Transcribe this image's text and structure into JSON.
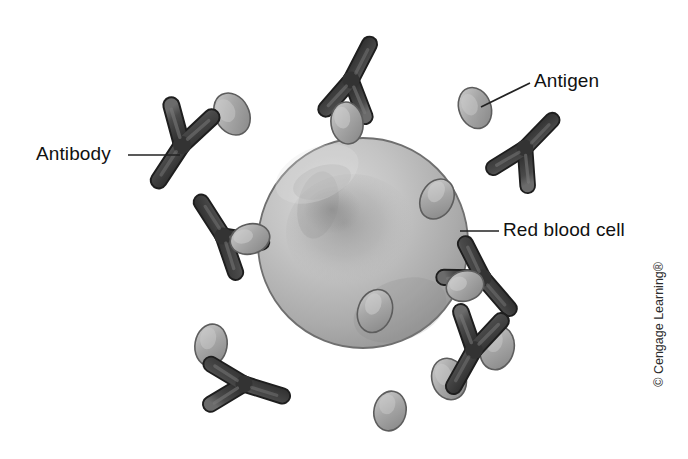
{
  "figure": {
    "background_color": "#ffffff",
    "width": 688,
    "height": 459
  },
  "labels": {
    "antibody": "Antibody",
    "antigen": "Antigen",
    "red_blood_cell": "Red blood cell"
  },
  "copyright": {
    "text": "© Cengage Learning®"
  },
  "colors": {
    "antibody_dark": "#3a3a3a",
    "antibody_mid": "#4e4e4e",
    "antibody_light": "#6d6d6d",
    "antigen_fill": "#9a9a9a",
    "antigen_light": "#bdbdbd",
    "antigen_outline": "#5d5d5d",
    "cell_light": "#cfcfcf",
    "cell_mid": "#aeaeae",
    "cell_dark": "#8c8c8c",
    "cell_outline": "#6a6a6a",
    "leader_line": "#222222",
    "text": "#111111"
  },
  "cell": {
    "name": "red-blood-cell",
    "center_x": 363,
    "center_y": 243,
    "radius": 105
  },
  "antigens": [
    {
      "id": "antigen-free-upper-left",
      "cx": 232,
      "cy": 114,
      "rx": 17,
      "ry": 22,
      "rot": -28
    },
    {
      "id": "antigen-labeled-upper-right",
      "cx": 475,
      "cy": 108,
      "rx": 16,
      "ry": 21,
      "rot": -20
    },
    {
      "id": "antigen-on-cell-top",
      "cx": 347,
      "cy": 123,
      "rx": 16,
      "ry": 21,
      "rot": -8
    },
    {
      "id": "antigen-on-cell-left",
      "cx": 250,
      "cy": 239,
      "rx": 20,
      "ry": 15,
      "rot": -14
    },
    {
      "id": "antigen-on-cell-right",
      "cx": 437,
      "cy": 199,
      "rx": 16,
      "ry": 21,
      "rot": 28
    },
    {
      "id": "antigen-on-cell-lower",
      "cx": 375,
      "cy": 311,
      "rx": 17,
      "ry": 22,
      "rot": 20
    },
    {
      "id": "antigen-on-cell-right-low",
      "cx": 465,
      "cy": 286,
      "rx": 19,
      "ry": 15,
      "rot": -16
    },
    {
      "id": "antigen-free-lower-left",
      "cx": 211,
      "cy": 345,
      "rx": 16,
      "ry": 21,
      "rot": 10
    },
    {
      "id": "antigen-free-bottom",
      "cx": 449,
      "cy": 379,
      "rx": 17,
      "ry": 21,
      "rot": -18
    },
    {
      "id": "antigen-free-bottom-left",
      "cx": 390,
      "cy": 411,
      "rx": 16,
      "ry": 20,
      "rot": 12
    },
    {
      "id": "antigen-behind-antibody-lower-right",
      "cx": 497,
      "cy": 348,
      "rx": 17,
      "ry": 22,
      "rot": 14
    }
  ],
  "antibodies": [
    {
      "id": "antibody-labeled-left",
      "x": 182,
      "y": 145,
      "rot": 14,
      "scale": 1.0
    },
    {
      "id": "antibody-top-on-cell",
      "x": 351,
      "y": 80,
      "rot": 188,
      "scale": 0.95
    },
    {
      "id": "antibody-upper-right",
      "x": 525,
      "y": 148,
      "rot": 205,
      "scale": 0.92
    },
    {
      "id": "antibody-left-on-cell",
      "x": 223,
      "y": 236,
      "rot": 128,
      "scale": 0.95
    },
    {
      "id": "antibody-right-on-cell",
      "x": 483,
      "y": 278,
      "rot": 300,
      "scale": 0.95
    },
    {
      "id": "antibody-bottom-left",
      "x": 244,
      "y": 384,
      "rot": 268,
      "scale": 0.95
    },
    {
      "id": "antibody-bottom-right",
      "x": 474,
      "y": 350,
      "rot": 10,
      "scale": 0.98
    }
  ],
  "leaders": [
    {
      "id": "leader-antibody",
      "x1": 128,
      "y1": 155,
      "x2": 180,
      "y2": 155
    },
    {
      "id": "leader-antigen",
      "x1": 530,
      "y1": 83,
      "x2": 481,
      "y2": 107
    },
    {
      "id": "leader-rbc",
      "x1": 499,
      "y1": 231,
      "x2": 460,
      "y2": 231
    }
  ]
}
